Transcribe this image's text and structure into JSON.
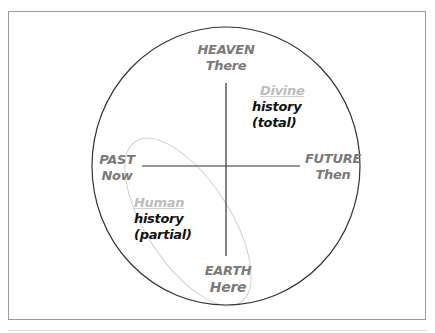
{
  "diagram": {
    "type": "circle-quadrant",
    "colors": {
      "frame": "#9a9a9a",
      "circle": "#333333",
      "axes": "#333333",
      "ellipse": "#cfcfcf",
      "pole_labels": "#7a7a7a",
      "history_heading": "#bdbdbd",
      "history_text": "#111111"
    },
    "poles": {
      "top": {
        "line1": "HEAVEN",
        "line2": "There"
      },
      "bottom": {
        "line1": "EARTH",
        "line2": "Here"
      },
      "left": {
        "line1": "PAST",
        "line2": "Now"
      },
      "right": {
        "line1": "FUTURE",
        "line2": "Then"
      }
    },
    "quadrants": {
      "upper_right": {
        "heading": "Divine",
        "line1": "history",
        "line2": "(total)"
      },
      "lower_left": {
        "heading": "Human",
        "line1": "history",
        "line2": "(partial)"
      }
    }
  }
}
